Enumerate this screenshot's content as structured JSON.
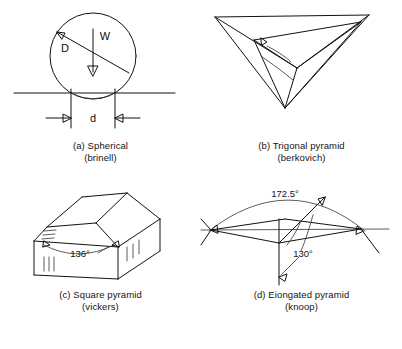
{
  "figure": {
    "panels": [
      {
        "key": "a",
        "caption_line1": "(a) Spherical",
        "caption_line2": "(brinell)",
        "labels": {
          "diameter": "D",
          "load": "W",
          "impression": "d"
        }
      },
      {
        "key": "b",
        "caption_line1": "(b) Trigonal pyramid",
        "caption_line2": "(berkovich)",
        "labels": {}
      },
      {
        "key": "c",
        "caption_line1": "(c) Square pyramid",
        "caption_line2": "(vickers)",
        "labels": {
          "apex_angle": "136°"
        }
      },
      {
        "key": "d",
        "caption_line1": "(d) Eiongated pyramid",
        "caption_line2": "(knoop)",
        "labels": {
          "long_angle": "172.5°",
          "short_angle": "130°"
        }
      }
    ],
    "bottom_clipped_text": "",
    "colors": {
      "line": "#111111",
      "background": "#ffffff",
      "text": "#141414"
    }
  }
}
